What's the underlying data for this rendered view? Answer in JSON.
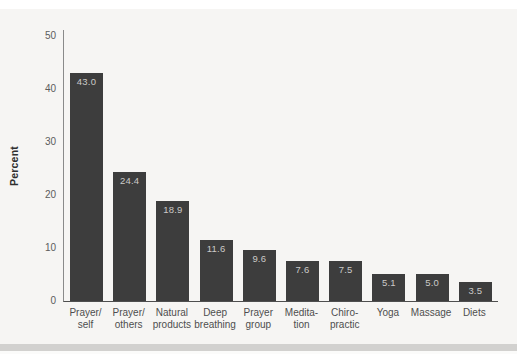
{
  "chart_data": {
    "type": "bar",
    "title": "",
    "xlabel": "",
    "ylabel": "Percent",
    "ylim": [
      0,
      50
    ],
    "yticks": [
      0,
      10,
      20,
      30,
      40,
      50
    ],
    "grid": false,
    "legend": "none",
    "categories": [
      [
        "Prayer/",
        "self"
      ],
      [
        "Prayer/",
        "others"
      ],
      [
        "Natural",
        "products"
      ],
      [
        "Deep",
        "breathing"
      ],
      [
        "Prayer",
        "group"
      ],
      [
        "Medita-",
        "tion"
      ],
      [
        "Chiro-",
        "practic"
      ],
      [
        "Yoga"
      ],
      [
        "Massage"
      ],
      [
        "Diets"
      ]
    ],
    "values": [
      43.0,
      24.4,
      18.9,
      11.6,
      9.6,
      7.6,
      7.5,
      5.1,
      5.0,
      3.5
    ],
    "value_labels": [
      "43.0",
      "24.4",
      "18.9",
      "11.6",
      "9.6",
      "7.6",
      "7.5",
      "5.1",
      "5.0",
      "3.5"
    ],
    "colors": {
      "bar": "#3d3d3d",
      "bar_value_text": "#cbcac8",
      "axis_line": "#6e6e6e",
      "tick_text": "#5c5c5c",
      "category_text": "#4e4e4e",
      "axis_title_text": "#2e2e2e",
      "paper_background": "#f6f5f3",
      "bottom_band": "#d2d1cf",
      "top_strip": "#ffffff"
    }
  }
}
